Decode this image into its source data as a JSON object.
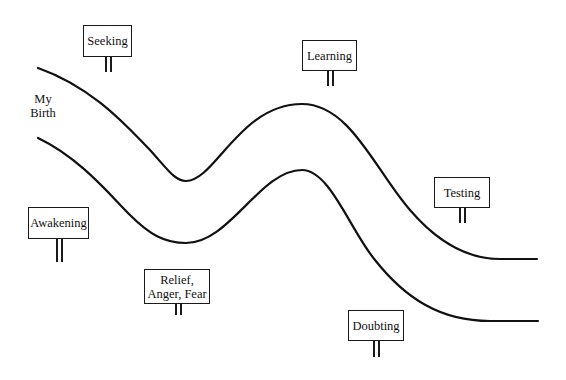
{
  "diagram": {
    "start_label": "My\nBirth",
    "river": {
      "upper_bank_path": "M38,68 C95,88 130,130 150,150 C168,170 175,181 186,181 C215,181 240,104 302,104 C350,104 375,170 410,210 C440,245 470,259 500,259 L537,259",
      "lower_bank_path": "M38,138 C80,158 110,195 130,215 C150,235 165,243 186,243 C230,243 260,170 302,170 C330,170 350,230 375,260 C405,298 440,321 490,321 L538,321",
      "stroke_color": "#111111"
    },
    "signs": [
      {
        "id": "seeking",
        "text": "Seeking",
        "x": 83,
        "y": 25,
        "w": 49,
        "h": 32,
        "post_x": 105,
        "post_len": 15
      },
      {
        "id": "learning",
        "text": "Learning",
        "x": 302,
        "y": 40,
        "w": 55,
        "h": 31,
        "post_x": 327,
        "post_len": 15
      },
      {
        "id": "testing",
        "text": "Testing",
        "x": 434,
        "y": 177,
        "w": 56,
        "h": 31,
        "post_x": 459,
        "post_len": 15
      },
      {
        "id": "awakening",
        "text": "Awakening",
        "x": 28,
        "y": 207,
        "w": 61,
        "h": 32,
        "post_x": 56,
        "post_len": 23
      },
      {
        "id": "relief",
        "text": "Relief,\nAnger, Fear",
        "x": 144,
        "y": 269,
        "w": 66,
        "h": 35,
        "post_x": 175,
        "post_len": 11
      },
      {
        "id": "doubting",
        "text": "Doubting",
        "x": 348,
        "y": 310,
        "w": 56,
        "h": 31,
        "post_x": 373,
        "post_len": 16
      }
    ]
  }
}
